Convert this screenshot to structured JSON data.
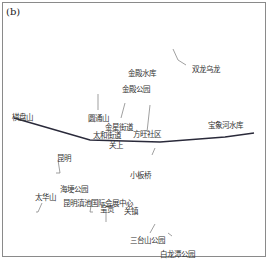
{
  "panel_label": "(b)",
  "colors": {
    "route_line": "#2a2a3a",
    "leader_line": "#777777",
    "frame": "#8a8a8a",
    "text": "#333333"
  },
  "labels": [
    {
      "id": "shuanglong-wulong",
      "text": "双龙乌龙",
      "x": 192,
      "y": 66
    },
    {
      "id": "jindian-reservoir",
      "text": "金殿水库",
      "x": 128,
      "y": 70
    },
    {
      "id": "jindian-park",
      "text": "金殿公园",
      "x": 122,
      "y": 86
    },
    {
      "id": "yuantong-shan",
      "text": "圆通山",
      "x": 88,
      "y": 115
    },
    {
      "id": "jinxing-jiedao",
      "text": "金星街道",
      "x": 105,
      "y": 124
    },
    {
      "id": "taihe-jiedao",
      "text": "太和街道",
      "x": 93,
      "y": 132
    },
    {
      "id": "fanghong-shequ",
      "text": "方旺社区",
      "x": 133,
      "y": 131
    },
    {
      "id": "qipan-shan",
      "text": "棋盘山",
      "x": 12,
      "y": 114
    },
    {
      "id": "baoxiang-reservoir",
      "text": "宝象河水库",
      "x": 208,
      "y": 122
    },
    {
      "id": "guanshang",
      "text": "关上",
      "x": 109,
      "y": 142
    },
    {
      "id": "kunming",
      "text": "昆明",
      "x": 57,
      "y": 155
    },
    {
      "id": "xiaobanqiao",
      "text": "小板桥",
      "x": 130,
      "y": 172
    },
    {
      "id": "haigeng-park",
      "text": "海埂公园",
      "x": 60,
      "y": 186
    },
    {
      "id": "taihua-shan",
      "text": "太华山",
      "x": 35,
      "y": 194
    },
    {
      "id": "kunming-dianchi-intl-conv-center",
      "text": "昆明滇池国际会展中心",
      "x": 63,
      "y": 200
    },
    {
      "id": "chenggong",
      "text": "呈贡",
      "x": 100,
      "y": 206
    },
    {
      "id": "guandu",
      "text": "关镇",
      "x": 124,
      "y": 208
    },
    {
      "id": "santaishan-park",
      "text": "三台山公园",
      "x": 130,
      "y": 237
    },
    {
      "id": "bailongtan-park",
      "text": "白龙潭公园",
      "x": 160,
      "y": 251
    }
  ],
  "route": {
    "name": "main-route-line",
    "points": [
      [
        14,
        118
      ],
      [
        90,
        140
      ],
      [
        160,
        142
      ],
      [
        225,
        137
      ],
      [
        254,
        133
      ]
    ]
  },
  "leaders": [
    [
      [
        173,
        49
      ],
      [
        178,
        60
      ],
      [
        186,
        65
      ]
    ],
    [
      [
        98,
        94
      ],
      [
        98,
        110
      ]
    ],
    [
      [
        125,
        103
      ],
      [
        121,
        118
      ]
    ],
    [
      [
        150,
        105
      ],
      [
        147,
        132
      ]
    ],
    [
      [
        58,
        160
      ],
      [
        60,
        173
      ],
      [
        56,
        173
      ]
    ],
    [
      [
        155,
        148
      ],
      [
        152,
        155
      ]
    ],
    [
      [
        42,
        203
      ],
      [
        38,
        212
      ],
      [
        36,
        212
      ]
    ],
    [
      [
        92,
        200
      ],
      [
        90,
        212
      ],
      [
        93,
        212
      ]
    ],
    [
      [
        106,
        210
      ],
      [
        106,
        222
      ]
    ],
    [
      [
        132,
        202
      ],
      [
        126,
        209
      ]
    ],
    [
      [
        155,
        224
      ],
      [
        150,
        233
      ]
    ],
    [
      [
        168,
        233
      ],
      [
        172,
        236
      ]
    ]
  ]
}
